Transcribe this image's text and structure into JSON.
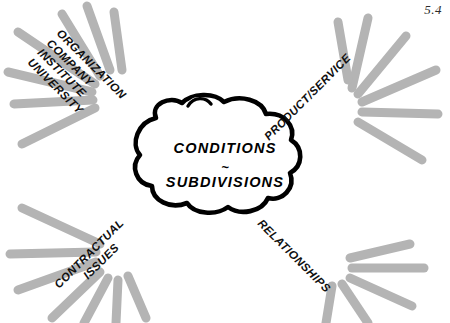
{
  "figure": {
    "number": "5.4",
    "background_color": "#ffffff",
    "ink_color": "#000000",
    "ray_color": "#b4b4b4"
  },
  "center": {
    "shape": "cloud",
    "line1": "CONDITIONS",
    "separator": "~",
    "line2": "SUBDIVISIONS"
  },
  "branches": [
    {
      "id": "organization",
      "position": "top-left",
      "rotation_deg": 45,
      "lines": [
        "ORGANIZATION",
        "COMPANY",
        "INSTITUTE",
        "UNIVERSITY"
      ]
    },
    {
      "id": "product-service",
      "position": "top-right",
      "rotation_deg": -45,
      "lines": [
        "PRODUCT/SERVICE"
      ]
    },
    {
      "id": "contractual-issues",
      "position": "bottom-left",
      "rotation_deg": -45,
      "lines": [
        "CONTRACTUAL",
        "ISSUES"
      ]
    },
    {
      "id": "relationships",
      "position": "bottom-right",
      "rotation_deg": 45,
      "lines": [
        "RELATIONSHIPS"
      ]
    }
  ],
  "bursts": [
    {
      "id": "burst-top-left",
      "origin_x": 108,
      "origin_y": 98,
      "rays": 7
    },
    {
      "id": "burst-top-right",
      "origin_x": 345,
      "origin_y": 98,
      "rays": 6
    },
    {
      "id": "burst-bottom-left",
      "origin_x": 108,
      "origin_y": 240,
      "rays": 7
    },
    {
      "id": "burst-bottom-right",
      "origin_x": 343,
      "origin_y": 248,
      "rays": 5
    }
  ]
}
